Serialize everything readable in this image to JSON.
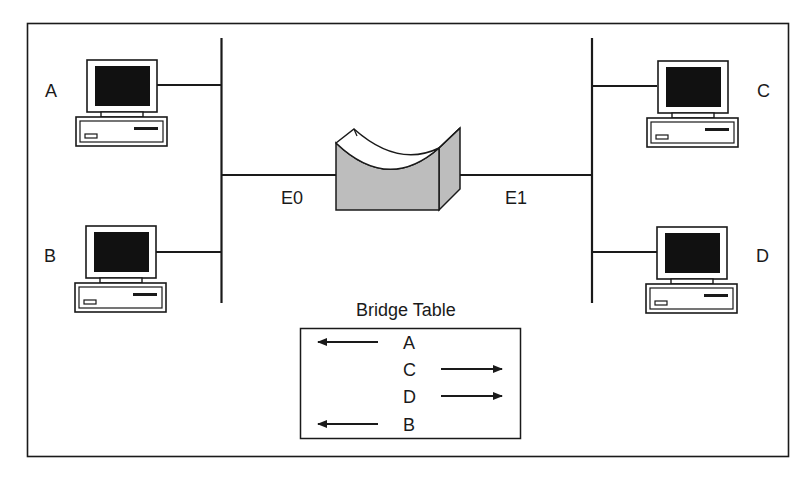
{
  "diagram": {
    "type": "network-bridge",
    "segments": [
      {
        "id": "E0",
        "label": "E0",
        "hosts": [
          "A",
          "B"
        ]
      },
      {
        "id": "E1",
        "label": "E1",
        "hosts": [
          "C",
          "D"
        ]
      }
    ],
    "hosts": {
      "A": {
        "label": "A"
      },
      "B": {
        "label": "B"
      },
      "C": {
        "label": "C"
      },
      "D": {
        "label": "D"
      }
    },
    "ports": {
      "e0": "E0",
      "e1": "E1"
    },
    "bridge_table": {
      "title": "Bridge Table",
      "rows": [
        {
          "host": "A",
          "direction": "left",
          "port": "E0"
        },
        {
          "host": "C",
          "direction": "right",
          "port": "E1"
        },
        {
          "host": "D",
          "direction": "right",
          "port": "E1"
        },
        {
          "host": "B",
          "direction": "left",
          "port": "E0"
        }
      ]
    },
    "colors": {
      "line": "#1a1a1a",
      "screen": "#111111",
      "bridge_fill": "#bdbdbd"
    }
  }
}
